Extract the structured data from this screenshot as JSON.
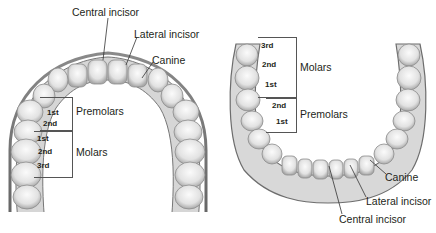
{
  "upper_arch": {
    "labels": {
      "central_incisor": "Central incisor",
      "lateral_incisor": "Lateral incisor",
      "canine": "Canine",
      "premolars": "Premolars",
      "molars": "Molars"
    },
    "premolar_numbers": [
      "1st",
      "2nd"
    ],
    "molar_numbers": [
      "1st",
      "2nd",
      "3rd"
    ]
  },
  "lower_arch": {
    "labels": {
      "central_incisor": "Central incisor",
      "lateral_incisor": "Lateral incisor",
      "canine": "Canine",
      "premolars": "Premolars",
      "molars": "Molars"
    },
    "premolar_numbers": [
      "2nd",
      "1st"
    ],
    "molar_numbers": [
      "3rd",
      "2nd",
      "1st"
    ]
  },
  "colors": {
    "tooth_light": "#f2f2f2",
    "tooth_shade": "#9a9a9a",
    "tooth_dark": "#5a5a5a",
    "text": "#231f20",
    "leader": "#333333"
  }
}
